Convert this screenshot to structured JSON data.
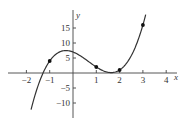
{
  "chart_data": {
    "type": "line",
    "title": "",
    "xlabel": "x",
    "ylabel": "y",
    "function": "f(x) = 2x^3 - 4x^2 - 3x + 7",
    "xlim": [
      -2.3,
      4.5
    ],
    "ylim": [
      -13,
      20
    ],
    "x_ticks": [
      -2,
      -1,
      1,
      2,
      3,
      4
    ],
    "x_tick_labels": [
      "−2",
      "−1",
      "1",
      "2",
      "3",
      "4"
    ],
    "y_ticks": [
      15,
      10,
      5,
      -5,
      -10
    ],
    "y_tick_labels": [
      "15",
      "10",
      "5",
      "−5",
      "−10"
    ],
    "grid": false,
    "legend": null,
    "curve_domain": [
      -1.8,
      3.12
    ],
    "series": [
      {
        "name": "curve",
        "x": [
          -1.8,
          -1.5,
          -1,
          -0.5,
          -0.3,
          0,
          0.5,
          1,
          1.5,
          1.64,
          2,
          2.5,
          3,
          3.12
        ],
        "y": [
          -12.2,
          -4.5,
          4,
          7.25,
          7.49,
          7,
          4.75,
          2,
          0.25,
          0.14,
          1,
          4.75,
          16,
          18.8
        ]
      }
    ],
    "points": [
      {
        "x": -1,
        "y": 4
      },
      {
        "x": 1,
        "y": 2
      },
      {
        "x": 2,
        "y": 1
      },
      {
        "x": 3,
        "y": 16
      }
    ]
  },
  "layout": {
    "origin_px": [
      73,
      73
    ],
    "x_scale_px": 23.3,
    "y_scale_px": 3.0,
    "x_axis_px": [
      8,
      177
    ],
    "y_axis_px": [
      10,
      118
    ]
  }
}
